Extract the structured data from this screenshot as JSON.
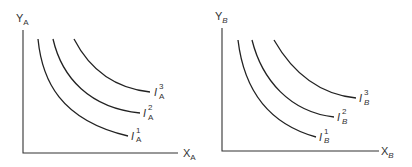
{
  "diagram": {
    "type": "indifference-curves",
    "panels": [
      {
        "id": "A",
        "y_axis_label": "Y",
        "y_axis_sub": "A",
        "x_axis_label": "X",
        "x_axis_sub": "A",
        "curves": [
          {
            "label": "I",
            "sub": "A",
            "sup": "1"
          },
          {
            "label": "I",
            "sub": "A",
            "sup": "2"
          },
          {
            "label": "I",
            "sub": "A",
            "sup": "3"
          }
        ]
      },
      {
        "id": "B",
        "y_axis_label": "Y",
        "y_axis_sub": "B",
        "x_axis_label": "X",
        "x_axis_sub": "B",
        "curves": [
          {
            "label": "I",
            "sub": "B",
            "sup": "1"
          },
          {
            "label": "I",
            "sub": "B",
            "sup": "2"
          },
          {
            "label": "I",
            "sub": "B",
            "sup": "3"
          }
        ]
      }
    ]
  }
}
